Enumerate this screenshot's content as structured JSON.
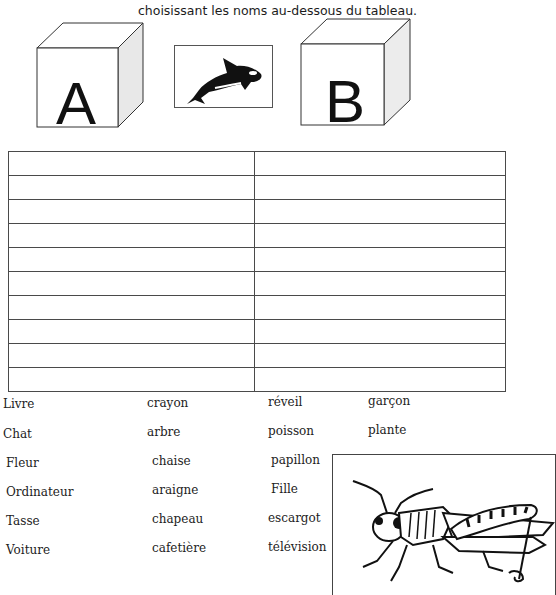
{
  "instruction": "choisissant les noms au-dessous du tableau.",
  "cubes": {
    "a": {
      "letter": "A"
    },
    "b": {
      "letter": "B"
    }
  },
  "pictures": {
    "center": "orca-whale",
    "corner": "grasshopper"
  },
  "table": {
    "columns": [
      "A",
      "B"
    ],
    "row_count": 10,
    "rows": [
      [
        "",
        ""
      ],
      [
        "",
        ""
      ],
      [
        "",
        ""
      ],
      [
        "",
        ""
      ],
      [
        "",
        ""
      ],
      [
        "",
        ""
      ],
      [
        "",
        ""
      ],
      [
        "",
        ""
      ],
      [
        "",
        ""
      ],
      [
        "",
        ""
      ]
    ]
  },
  "word_bank": {
    "col1": [
      "Livre",
      "Chat",
      "Fleur",
      "Ordinateur",
      "Tasse",
      "Voiture"
    ],
    "col2": [
      "crayon",
      "arbre",
      "chaise",
      "araigne",
      "chapeau",
      "cafetière"
    ],
    "col3": [
      "réveil",
      "poisson",
      "papillon",
      "Fille",
      "escargot",
      "télévision"
    ],
    "col4": [
      "garçon",
      "plante"
    ]
  }
}
